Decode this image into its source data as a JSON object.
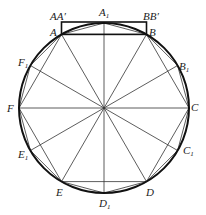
{
  "diagram": {
    "type": "circle-inscribed-dodecagon-construction",
    "center": [
      104,
      108
    ],
    "radius": 85,
    "vertices": [
      {
        "name": "A",
        "label": "A",
        "x": 61.5,
        "y": 34.4
      },
      {
        "name": "B",
        "label": "B",
        "x": 146.5,
        "y": 34.4
      },
      {
        "name": "C",
        "label": "C",
        "x": 189,
        "y": 108
      },
      {
        "name": "D",
        "label": "D",
        "x": 146.5,
        "y": 181.6
      },
      {
        "name": "E",
        "label": "E",
        "x": 61.5,
        "y": 181.6
      },
      {
        "name": "F",
        "label": "F",
        "x": 19,
        "y": 108
      }
    ],
    "midpoints": [
      {
        "name": "A1",
        "label": "A",
        "sub": "1",
        "x": 104,
        "y": 23
      },
      {
        "name": "B1",
        "label": "B",
        "sub": "1",
        "x": 177.6,
        "y": 65.5
      },
      {
        "name": "C1",
        "label": "C",
        "sub": "1",
        "x": 177.6,
        "y": 150.5
      },
      {
        "name": "D1",
        "label": "D",
        "sub": "1",
        "x": 104,
        "y": 193
      },
      {
        "name": "E1",
        "label": "E",
        "sub": "1",
        "x": 30.4,
        "y": 150.5
      },
      {
        "name": "F1",
        "label": "F",
        "sub": "1",
        "x": 30.4,
        "y": 65.5
      }
    ],
    "extra_labels": [
      {
        "name": "AA-prime",
        "text": "AA′"
      },
      {
        "name": "BB-prime",
        "text": "BB′"
      }
    ],
    "colors": {
      "line": "#333333",
      "circle": "#111111"
    }
  }
}
